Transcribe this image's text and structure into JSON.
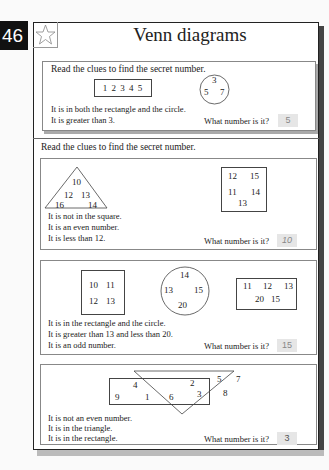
{
  "page_number": "46",
  "title": "Venn diagrams",
  "icons": {
    "star": "star-outline-icon"
  },
  "section1": {
    "instruction": "Read the clues to find the secret number.",
    "rectangle_numbers": "1 2 3 4 5",
    "circle_numbers": [
      "3",
      "5",
      "7"
    ],
    "clues": [
      "It is in both the rectangle and the circle.",
      "It is greater than 3."
    ],
    "question": "What number is it?",
    "answer": "5"
  },
  "section2": {
    "instruction": "Read the clues to find the secret number.",
    "puzzles": [
      {
        "triangle_numbers": [
          "10",
          "12",
          "13",
          "16",
          "14"
        ],
        "square_numbers": [
          "12",
          "15",
          "11",
          "14",
          "13"
        ],
        "clues": [
          "It is not in the square.",
          "It is an even number.",
          "It is less than 12."
        ],
        "question": "What number is it?",
        "answer": "10"
      },
      {
        "rect1_numbers": [
          "10",
          "11",
          "12",
          "13"
        ],
        "circle_numbers": [
          "14",
          "13",
          "15",
          "20"
        ],
        "rect2_numbers": [
          "11",
          "12",
          "13",
          "20",
          "15"
        ],
        "clues": [
          "It is in the rectangle and the circle.",
          "It is greater than 13 and less than 20.",
          "It is an odd number."
        ],
        "question": "What number is it?",
        "answer": "15"
      },
      {
        "rect_only_numbers": [
          "4",
          "9",
          "1",
          "6"
        ],
        "overlap_numbers": [
          "2",
          "3"
        ],
        "triangle_only_numbers": [
          "5",
          "7",
          "8"
        ],
        "clues": [
          "It is not an even number.",
          "It is in the triangle.",
          "It is in the rectangle."
        ],
        "question": "What number is it?",
        "answer": "3"
      }
    ]
  }
}
